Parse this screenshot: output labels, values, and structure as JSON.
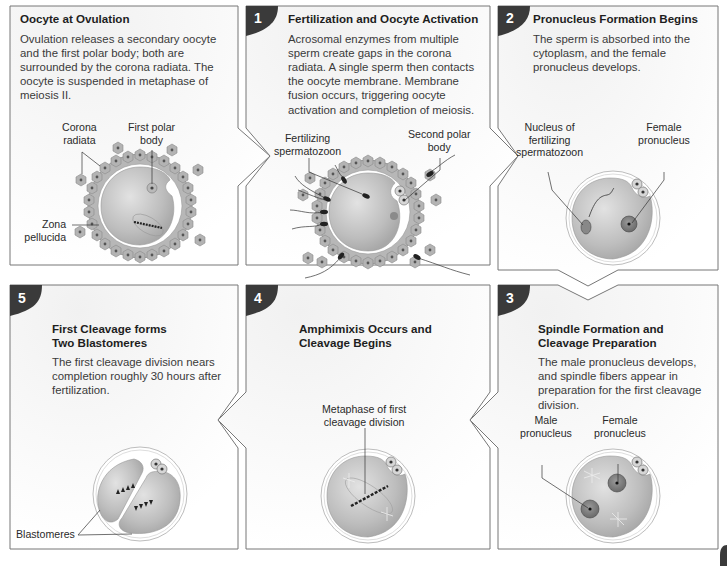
{
  "panels": [
    {
      "id": "ovulation",
      "step": "",
      "title": "Oocyte at Ovulation",
      "body": "Ovulation releases a secondary oocyte and the first polar body; both are surrounded by the corona radiata. The oocyte is suspended in metaphase of meiosis II.",
      "labels": [
        "Corona radiata",
        "First polar body",
        "Zona pellucida"
      ]
    },
    {
      "id": "fertilization",
      "step": "1",
      "title": "Fertilization and Oocyte Activation",
      "body": "Acrosomal enzymes from multiple sperm create gaps in the corona radiata. A single sperm then contacts the oocyte membrane. Membrane fusion occurs, triggering oocyte activation and completion of meiosis.",
      "labels": [
        "Fertilizing spermatozoon",
        "Second polar body"
      ]
    },
    {
      "id": "pronucleus-formation",
      "step": "2",
      "title": "Pronucleus Formation Begins",
      "body": "The sperm is absorbed into the cytoplasm, and the female pronucleus develops.",
      "labels": [
        "Nucleus of fertilizing spermatozoon",
        "Female pronucleus"
      ]
    },
    {
      "id": "spindle-formation",
      "step": "3",
      "title": "Spindle Formation and Cleavage Preparation",
      "body": "The male pronucleus develops, and spindle fibers appear in preparation for the first cleavage division.",
      "labels": [
        "Male pronucleus",
        "Female pronucleus"
      ]
    },
    {
      "id": "amphimixis",
      "step": "4",
      "title": "Amphimixis Occurs and Cleavage Begins",
      "body": "",
      "labels": [
        "Metaphase of first cleavage division"
      ]
    },
    {
      "id": "first-cleavage",
      "step": "5",
      "title": "First Cleavage forms Two Blastomeres",
      "body": "The first cleavage division nears completion roughly 30 hours after fertilization.",
      "labels": [
        "Blastomeres"
      ]
    }
  ],
  "text": {
    "p0_title": "Oocyte at Ovulation",
    "p0_body": "Ovulation releases a secondary oocyte and the first polar body; both are surrounded by the corona radiata. The oocyte is suspended in metaphase of meiosis II.",
    "p0_l1a": "Corona",
    "p0_l1b": "radiata",
    "p0_l2a": "First polar",
    "p0_l2b": "body",
    "p0_l3a": "Zona",
    "p0_l3b": "pellucida",
    "p1_step": "1",
    "p1_title": "Fertilization and Oocyte Activation",
    "p1_body": "Acrosomal enzymes from multiple sperm create gaps in the corona radiata. A single sperm then contacts the oocyte membrane. Membrane fusion occurs, triggering oocyte activation and completion of meiosis.",
    "p1_l1a": "Fertilizing",
    "p1_l1b": "spermatozoon",
    "p1_l2a": "Second polar",
    "p1_l2b": "body",
    "p2_step": "2",
    "p2_title": "Pronucleus Formation Begins",
    "p2_body": "The sperm is absorbed into the cytoplasm, and the female pronucleus develops.",
    "p2_l1a": "Nucleus of",
    "p2_l1b": "fertilizing",
    "p2_l1c": "spermatozoon",
    "p2_l2a": "Female",
    "p2_l2b": "pronucleus",
    "p3_step": "3",
    "p3_title_a": "Spindle Formation and",
    "p3_title_b": "Cleavage Preparation",
    "p3_body": "The male pronucleus develops, and spindle fibers appear in preparation for the first cleavage division.",
    "p3_l1a": "Male",
    "p3_l1b": "pronucleus",
    "p3_l2a": "Female",
    "p3_l2b": "pronucleus",
    "p4_step": "4",
    "p4_title_a": "Amphimixis Occurs and",
    "p4_title_b": "Cleavage Begins",
    "p4_l1a": "Metaphase of first",
    "p4_l1b": "cleavage division",
    "p5_step": "5",
    "p5_title_a": "First Cleavage forms",
    "p5_title_b": "Two Blastomeres",
    "p5_body": "The first cleavage division nears completion roughly 30 hours after fertilization.",
    "p5_l1": "Blastomeres"
  },
  "colors": {
    "badge": "#3a3a3a",
    "panel_border": "#707070",
    "panel_fill": "#f4f4f4",
    "cell_fill": "#b5b5b5",
    "cell_nucleus": "#5a5a5a",
    "zona": "#ffffff",
    "oocyte_fill": "#c9c9c9"
  }
}
